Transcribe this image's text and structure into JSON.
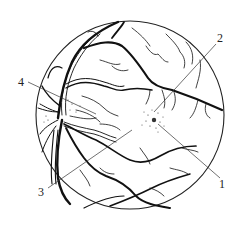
{
  "figure": {
    "labels": [
      {
        "id": "1",
        "text": "1",
        "points_to": "macula fovea dark spot"
      },
      {
        "id": "2",
        "text": "2",
        "points_to": "macular scattered dots region"
      },
      {
        "id": "3",
        "text": "3",
        "points_to": "retina between vessels"
      },
      {
        "id": "4",
        "text": "4",
        "points_to": "optic disc edge area"
      }
    ],
    "colors": {
      "ink": "#111111",
      "background": "#ffffff",
      "label": "#222222"
    }
  }
}
